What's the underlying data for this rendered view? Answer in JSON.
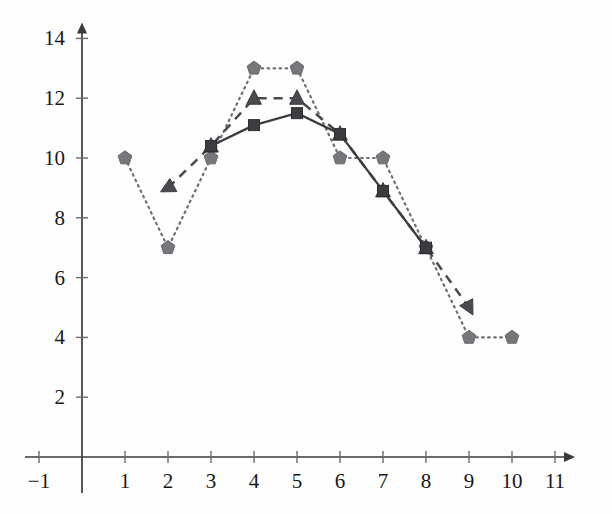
{
  "chart_data": {
    "type": "line",
    "title": "",
    "subtitle": "",
    "xlabel": "",
    "ylabel": "",
    "xlim": [
      -1,
      11
    ],
    "ylim": [
      0,
      14
    ],
    "grid": false,
    "legend": "none",
    "x_ticks": [
      "-1",
      "1",
      "2",
      "3",
      "4",
      "5",
      "6",
      "7",
      "8",
      "9",
      "10",
      "11"
    ],
    "x_tick_values": [
      -1,
      1,
      2,
      3,
      4,
      5,
      6,
      7,
      8,
      9,
      10,
      11
    ],
    "y_ticks": [
      "2",
      "4",
      "6",
      "8",
      "10",
      "12",
      "14"
    ],
    "y_tick_values": [
      2,
      4,
      6,
      8,
      10,
      12,
      14
    ],
    "series": [
      {
        "name": "dotted-pentagon-series",
        "marker": "pentagon",
        "linestyle": "dotted",
        "color": "#76767b",
        "x": [
          1,
          2,
          3,
          4,
          5,
          6,
          7,
          8,
          9,
          10
        ],
        "values": [
          10,
          7,
          10,
          13,
          13,
          10,
          10,
          7,
          4,
          4
        ]
      },
      {
        "name": "dashed-triangle-series",
        "marker": "triangle",
        "linestyle": "dashed",
        "color": "#4a4a4e",
        "x": [
          2,
          3,
          4,
          5,
          6,
          7,
          8,
          9
        ],
        "values": [
          9,
          10.4,
          12,
          12,
          10.8,
          8.9,
          7,
          5
        ]
      },
      {
        "name": "solid-square-series",
        "marker": "square",
        "linestyle": "solid",
        "color": "#3c3c40",
        "x": [
          3,
          4,
          5,
          6,
          7,
          8
        ],
        "values": [
          10.4,
          11.1,
          11.5,
          10.8,
          8.9,
          7
        ]
      }
    ]
  },
  "axes": {
    "x_axis_name": "x-axis",
    "y_axis_name": "y-axis",
    "x_arrow": "arrow-right",
    "y_arrow": "arrow-up"
  },
  "geometry": {
    "origin_x": 82,
    "origin_y": 457,
    "unit_x": 43,
    "unit_y": 29.9
  }
}
